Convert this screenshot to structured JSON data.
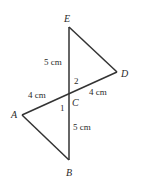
{
  "diagram": {
    "line_color": "#333333",
    "points": {
      "E": {
        "label": "E"
      },
      "D": {
        "label": "D"
      },
      "C": {
        "label": "C"
      },
      "A": {
        "label": "A"
      },
      "B": {
        "label": "B"
      }
    },
    "measurements": {
      "EC": "5 cm",
      "AC": "4 cm",
      "CD": "4 cm",
      "CB": "5 cm"
    },
    "angles": {
      "angle1": "1",
      "angle2": "2"
    }
  }
}
